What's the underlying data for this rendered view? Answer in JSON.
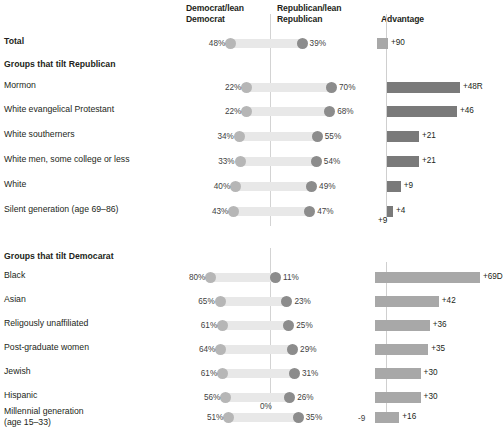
{
  "header": {
    "col_dem": "Democrat/lean\nDemocrat",
    "col_rep": "Republican/lean\nRepublican",
    "col_adv": "Advantage"
  },
  "sections": {
    "republican": "Groups that tilt Republican",
    "democrat": "Groups that tilt Democarat"
  },
  "axis": {
    "dumbbell_zero": "0%",
    "adv_tick_neg9": "-9",
    "adv_tick_0": "0",
    "stray_label": "+9"
  },
  "chart_data": {
    "type": "bar",
    "xlabel": "",
    "ylabel": "",
    "series": [
      {
        "name": "Democrat/lean Democrat",
        "color": "#b6b6b6"
      },
      {
        "name": "Republican/lean Republican",
        "color": "#8c8c8c"
      },
      {
        "name": "Advantage",
        "color": "#7a7a7a"
      }
    ],
    "rows": [
      {
        "label": "Total",
        "bold": true,
        "group": "total",
        "dem": 48,
        "dem_text": "48%",
        "rep": 39,
        "rep_text": "39%",
        "advantage": 9,
        "adv_text": "+90",
        "adv_dir": "D"
      },
      {
        "label": "Mormon",
        "bold": false,
        "group": "republican",
        "dem": 22,
        "dem_text": "22%",
        "rep": 70,
        "rep_text": "70%",
        "advantage": 48,
        "adv_text": "+48R",
        "adv_dir": "R"
      },
      {
        "label": "White evangelical Protestant",
        "bold": false,
        "group": "republican",
        "dem": 22,
        "dem_text": "22%",
        "rep": 68,
        "rep_text": "68%",
        "advantage": 46,
        "adv_text": "+46",
        "adv_dir": "R"
      },
      {
        "label": "White southerners",
        "bold": false,
        "group": "republican",
        "dem": 34,
        "dem_text": "34%",
        "rep": 55,
        "rep_text": "55%",
        "advantage": 21,
        "adv_text": "+21",
        "adv_dir": "R"
      },
      {
        "label": "White men, some college or less",
        "bold": false,
        "group": "republican",
        "dem": 33,
        "dem_text": "33%",
        "rep": 54,
        "rep_text": "54%",
        "advantage": 21,
        "adv_text": "+21",
        "adv_dir": "R"
      },
      {
        "label": "White",
        "bold": false,
        "group": "republican",
        "dem": 40,
        "dem_text": "40%",
        "rep": 49,
        "rep_text": "49%",
        "advantage": 9,
        "adv_text": "+9",
        "adv_dir": "R"
      },
      {
        "label": "Silent generation (age 69–86)",
        "bold": false,
        "group": "republican",
        "dem": 43,
        "dem_text": "43%",
        "rep": 47,
        "rep_text": "47%",
        "advantage": 4,
        "adv_text": "+4",
        "adv_dir": "R"
      },
      {
        "label": "Black",
        "bold": false,
        "group": "democrat",
        "dem": 80,
        "dem_text": "80%",
        "rep": 11,
        "rep_text": "11%",
        "advantage": 69,
        "adv_text": "+69D",
        "adv_dir": "D"
      },
      {
        "label": "Asian",
        "bold": false,
        "group": "democrat",
        "dem": 65,
        "dem_text": "65%",
        "rep": 23,
        "rep_text": "23%",
        "advantage": 42,
        "adv_text": "+42",
        "adv_dir": "D"
      },
      {
        "label": "Religously unaffiliated",
        "bold": false,
        "group": "democrat",
        "dem": 61,
        "dem_text": "61%",
        "rep": 25,
        "rep_text": "25%",
        "advantage": 36,
        "adv_text": "+36",
        "adv_dir": "D"
      },
      {
        "label": "Post-graduate women",
        "bold": false,
        "group": "democrat",
        "dem": 64,
        "dem_text": "64%",
        "rep": 29,
        "rep_text": "29%",
        "advantage": 35,
        "adv_text": "+35",
        "adv_dir": "D"
      },
      {
        "label": "Jewish",
        "bold": false,
        "group": "democrat",
        "dem": 61,
        "dem_text": "61%",
        "rep": 31,
        "rep_text": "31%",
        "advantage": 30,
        "adv_text": "+30",
        "adv_dir": "D"
      },
      {
        "label": "Hispanic",
        "bold": false,
        "group": "democrat",
        "dem": 56,
        "dem_text": "56%",
        "rep": 26,
        "rep_text": "26%",
        "advantage": 30,
        "adv_text": "+30",
        "adv_dir": "D"
      },
      {
        "label": "Millennial generation\n(age 15–33)",
        "bold": false,
        "group": "democrat",
        "dem": 51,
        "dem_text": "51%",
        "rep": 35,
        "rep_text": "35%",
        "advantage": 16,
        "adv_text": "+16",
        "adv_dir": "D"
      }
    ],
    "colors": {
      "dem_dot": "#b6b6b6",
      "rep_dot": "#8c8c8c",
      "track": "#e8e8e8",
      "adv_rep": "#7a7a7a",
      "adv_dem": "#a8a8a8",
      "gridline": "#d3d3d3"
    }
  }
}
